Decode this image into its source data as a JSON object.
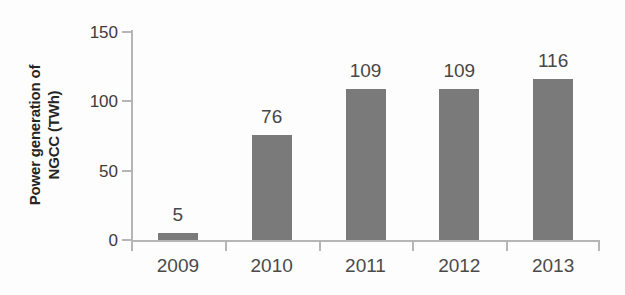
{
  "chart_data": {
    "type": "bar",
    "title": "",
    "subtitle": "",
    "xlabel": "",
    "ylabel_lines": [
      "Power generation of",
      "NGCC (TWh)"
    ],
    "ylabel": "Power generation of NGCC (TWh)",
    "categories": [
      "2009",
      "2010",
      "2011",
      "2012",
      "2013"
    ],
    "values": [
      5,
      76,
      109,
      109,
      116
    ],
    "value_labels": [
      "5",
      "76",
      "109",
      "109",
      "116"
    ],
    "ylim": [
      0,
      150
    ],
    "yticks": [
      0,
      50,
      100,
      150
    ],
    "ytick_labels": [
      "0",
      "50",
      "100",
      "150"
    ],
    "grid": false,
    "legend": null,
    "bar_color": "#7a7a7a",
    "axis_color": "#b6b6b6",
    "text_color": "#3c3c3c",
    "background_color": "#fdfdfd"
  }
}
